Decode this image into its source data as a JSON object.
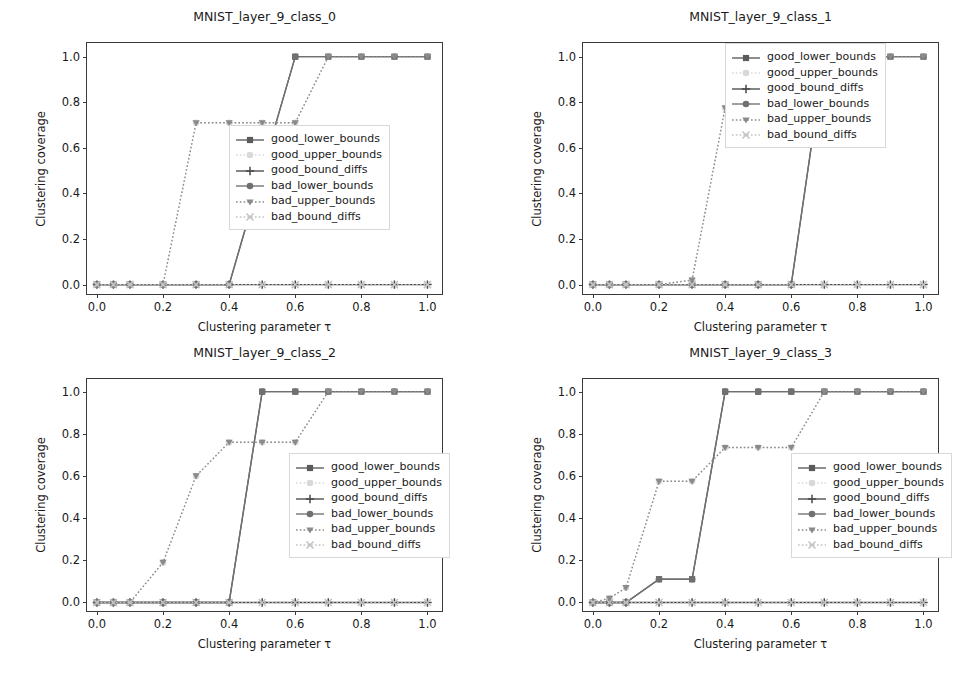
{
  "figure": {
    "background": "#ffffff",
    "axis_color": "#3a3a3a",
    "text_color": "#1a1a1a"
  },
  "legend": {
    "entries": [
      {
        "label": "good_lower_bounds",
        "color": "#5a5a5a",
        "marker": "square",
        "linestyle": "solid",
        "key_name": "legend-key-good-lower-bounds"
      },
      {
        "label": "good_upper_bounds",
        "color": "#d9d9d9",
        "marker": "circle",
        "linestyle": "dotted",
        "key_name": "legend-key-good-upper-bounds"
      },
      {
        "label": "good_bound_diffs",
        "color": "#4a4a4a",
        "marker": "plus",
        "linestyle": "solid",
        "key_name": "legend-key-good-bound-diffs"
      },
      {
        "label": "bad_lower_bounds",
        "color": "#707070",
        "marker": "circle",
        "linestyle": "solid",
        "key_name": "legend-key-bad-lower-bounds"
      },
      {
        "label": "bad_upper_bounds",
        "color": "#8a8a8a",
        "marker": "tri_down",
        "linestyle": "dotted",
        "key_name": "legend-key-bad-upper-bounds"
      },
      {
        "label": "bad_bound_diffs",
        "color": "#c2c2c2",
        "marker": "x",
        "linestyle": "dotted",
        "key_name": "legend-key-bad-bound-diffs"
      }
    ]
  },
  "axis_common": {
    "xlabel": "Clustering parameter τ",
    "ylabel": "Clustering coverage",
    "xticks": [
      0.0,
      0.2,
      0.4,
      0.6,
      0.8,
      1.0
    ],
    "xticklabels": [
      "0.0",
      "0.2",
      "0.4",
      "0.6",
      "0.8",
      "1.0"
    ],
    "yticks": [
      0.0,
      0.2,
      0.4,
      0.6,
      0.8,
      1.0
    ],
    "yticklabels": [
      "0.0",
      "0.2",
      "0.4",
      "0.6",
      "0.8",
      "1.0"
    ],
    "xlim": [
      -0.03,
      1.05
    ],
    "ylim": [
      -0.05,
      1.06
    ],
    "grid": false,
    "legend_position": "center right"
  },
  "chart_data": [
    {
      "type": "line",
      "title": "MNIST_layer_9_class_0",
      "xlabel": "Clustering parameter τ",
      "ylabel": "Clustering coverage",
      "xlim": [
        -0.03,
        1.05
      ],
      "ylim": [
        -0.05,
        1.06
      ],
      "grid": false,
      "x": [
        0.0,
        0.05,
        0.1,
        0.2,
        0.3,
        0.4,
        0.5,
        0.6,
        0.7,
        0.8,
        0.9,
        1.0
      ],
      "series": [
        {
          "name": "good_lower_bounds",
          "values": [
            0.0,
            0.0,
            0.0,
            0.0,
            0.0,
            0.0,
            0.5,
            1.0,
            1.0,
            1.0,
            1.0,
            1.0
          ]
        },
        {
          "name": "good_upper_bounds",
          "values": [
            0.0,
            0.0,
            0.0,
            0.0,
            0.71,
            0.71,
            0.71,
            0.71,
            1.0,
            1.0,
            1.0,
            1.0
          ]
        },
        {
          "name": "good_bound_diffs",
          "values": [
            0.0,
            0.0,
            0.0,
            0.0,
            0.0,
            0.0,
            0.0,
            0.0,
            0.0,
            0.0,
            0.0,
            0.0
          ]
        },
        {
          "name": "bad_lower_bounds",
          "values": [
            0.0,
            0.0,
            0.0,
            0.0,
            0.0,
            0.0,
            0.5,
            1.0,
            1.0,
            1.0,
            1.0,
            1.0
          ]
        },
        {
          "name": "bad_upper_bounds",
          "values": [
            0.0,
            0.0,
            0.0,
            0.0,
            0.71,
            0.71,
            0.71,
            0.71,
            1.0,
            1.0,
            1.0,
            1.0
          ]
        },
        {
          "name": "bad_bound_diffs",
          "values": [
            0.0,
            0.0,
            0.0,
            0.0,
            0.0,
            0.0,
            0.0,
            0.0,
            0.0,
            0.0,
            0.0,
            0.0
          ]
        }
      ]
    },
    {
      "type": "line",
      "title": "MNIST_layer_9_class_1",
      "xlabel": "Clustering parameter τ",
      "ylabel": "Clustering coverage",
      "xlim": [
        -0.03,
        1.05
      ],
      "ylim": [
        -0.05,
        1.06
      ],
      "grid": false,
      "x": [
        0.0,
        0.05,
        0.1,
        0.2,
        0.3,
        0.4,
        0.5,
        0.6,
        0.7,
        0.8,
        0.9,
        1.0
      ],
      "series": [
        {
          "name": "good_lower_bounds",
          "values": [
            0.0,
            0.0,
            0.0,
            0.0,
            0.0,
            0.0,
            0.0,
            0.0,
            1.0,
            1.0,
            1.0,
            1.0
          ]
        },
        {
          "name": "good_upper_bounds",
          "values": [
            0.0,
            0.0,
            0.0,
            0.0,
            0.02,
            0.775,
            0.775,
            0.775,
            1.0,
            1.0,
            1.0,
            1.0
          ]
        },
        {
          "name": "good_bound_diffs",
          "values": [
            0.0,
            0.0,
            0.0,
            0.0,
            0.0,
            0.0,
            0.0,
            0.0,
            0.0,
            0.0,
            0.0,
            0.0
          ]
        },
        {
          "name": "bad_lower_bounds",
          "values": [
            0.0,
            0.0,
            0.0,
            0.0,
            0.0,
            0.0,
            0.0,
            0.0,
            1.0,
            1.0,
            1.0,
            1.0
          ]
        },
        {
          "name": "bad_upper_bounds",
          "values": [
            0.0,
            0.0,
            0.0,
            0.0,
            0.02,
            0.775,
            0.775,
            0.775,
            1.0,
            1.0,
            1.0,
            1.0
          ]
        },
        {
          "name": "bad_bound_diffs",
          "values": [
            0.0,
            0.0,
            0.0,
            0.0,
            0.0,
            0.0,
            0.0,
            0.0,
            0.0,
            0.0,
            0.0,
            0.0
          ]
        }
      ]
    },
    {
      "type": "line",
      "title": "MNIST_layer_9_class_2",
      "xlabel": "Clustering parameter τ",
      "ylabel": "Clustering coverage",
      "xlim": [
        -0.03,
        1.05
      ],
      "ylim": [
        -0.05,
        1.06
      ],
      "grid": false,
      "x": [
        0.0,
        0.05,
        0.1,
        0.2,
        0.3,
        0.4,
        0.5,
        0.6,
        0.7,
        0.8,
        0.9,
        1.0
      ],
      "series": [
        {
          "name": "good_lower_bounds",
          "values": [
            0.0,
            0.0,
            0.0,
            0.0,
            0.0,
            0.0,
            1.0,
            1.0,
            1.0,
            1.0,
            1.0,
            1.0
          ]
        },
        {
          "name": "good_upper_bounds",
          "values": [
            0.0,
            0.0,
            0.0,
            0.19,
            0.6,
            0.76,
            0.76,
            0.76,
            1.0,
            1.0,
            1.0,
            1.0
          ]
        },
        {
          "name": "good_bound_diffs",
          "values": [
            0.0,
            0.0,
            0.0,
            0.0,
            0.0,
            0.0,
            0.0,
            0.0,
            0.0,
            0.0,
            0.0,
            0.0
          ]
        },
        {
          "name": "bad_lower_bounds",
          "values": [
            0.0,
            0.0,
            0.0,
            0.0,
            0.0,
            0.0,
            1.0,
            1.0,
            1.0,
            1.0,
            1.0,
            1.0
          ]
        },
        {
          "name": "bad_upper_bounds",
          "values": [
            0.0,
            0.0,
            0.0,
            0.19,
            0.6,
            0.76,
            0.76,
            0.76,
            1.0,
            1.0,
            1.0,
            1.0
          ]
        },
        {
          "name": "bad_bound_diffs",
          "values": [
            0.0,
            0.0,
            0.0,
            0.0,
            0.0,
            0.0,
            0.0,
            0.0,
            0.0,
            0.0,
            0.0,
            0.0
          ]
        }
      ]
    },
    {
      "type": "line",
      "title": "MNIST_layer_9_class_3",
      "xlabel": "Clustering parameter τ",
      "ylabel": "Clustering coverage",
      "xlim": [
        -0.03,
        1.05
      ],
      "ylim": [
        -0.05,
        1.06
      ],
      "grid": false,
      "x": [
        0.0,
        0.05,
        0.1,
        0.2,
        0.3,
        0.4,
        0.5,
        0.6,
        0.7,
        0.8,
        0.9,
        1.0
      ],
      "series": [
        {
          "name": "good_lower_bounds",
          "values": [
            0.0,
            0.0,
            0.0,
            0.11,
            0.11,
            1.0,
            1.0,
            1.0,
            1.0,
            1.0,
            1.0,
            1.0
          ]
        },
        {
          "name": "good_upper_bounds",
          "values": [
            0.0,
            0.02,
            0.07,
            0.575,
            0.575,
            0.735,
            0.735,
            0.735,
            1.0,
            1.0,
            1.0,
            1.0
          ]
        },
        {
          "name": "good_bound_diffs",
          "values": [
            0.0,
            0.0,
            0.0,
            0.0,
            0.0,
            0.0,
            0.0,
            0.0,
            0.0,
            0.0,
            0.0,
            0.0
          ]
        },
        {
          "name": "bad_lower_bounds",
          "values": [
            0.0,
            0.0,
            0.0,
            0.11,
            0.11,
            1.0,
            1.0,
            1.0,
            1.0,
            1.0,
            1.0,
            1.0
          ]
        },
        {
          "name": "bad_upper_bounds",
          "values": [
            0.0,
            0.02,
            0.07,
            0.575,
            0.575,
            0.735,
            0.735,
            0.735,
            1.0,
            1.0,
            1.0,
            1.0
          ]
        },
        {
          "name": "bad_bound_diffs",
          "values": [
            0.0,
            0.0,
            0.0,
            0.0,
            0.0,
            0.0,
            0.0,
            0.0,
            0.0,
            0.0,
            0.0,
            0.0
          ]
        }
      ]
    }
  ],
  "panels": [
    {
      "legend_left": 228,
      "legend_top": 124
    },
    {
      "legend_left": 724,
      "legend_top": 42
    },
    {
      "legend_left": 288,
      "legend_top": 452
    },
    {
      "legend_left": 790,
      "legend_top": 452
    }
  ]
}
